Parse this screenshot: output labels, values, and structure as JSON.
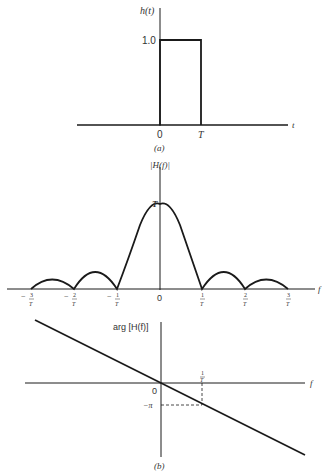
{
  "panel_a": {
    "caption": "(a)",
    "ylabel": "h(t)",
    "xlabel": "t",
    "y_tick": "1.0",
    "x_ticks": [
      "0",
      "T"
    ]
  },
  "panel_b_mag": {
    "ylabel": "|H(f)|",
    "xlabel": "f",
    "peak_label": "T",
    "origin_label": "0",
    "x_ticks": [
      {
        "sign": "−",
        "num": "3",
        "den": "T"
      },
      {
        "sign": "−",
        "num": "2",
        "den": "T"
      },
      {
        "sign": "−",
        "num": "1",
        "den": "T"
      },
      {
        "sign": "",
        "num": "1",
        "den": "T"
      },
      {
        "sign": "",
        "num": "2",
        "den": "T"
      },
      {
        "sign": "",
        "num": "3",
        "den": "T"
      }
    ]
  },
  "panel_b_phase": {
    "ylabel": "arg [H(f)]",
    "xlabel": "f",
    "origin_label": "0",
    "y_tick": "−π",
    "x_tick_num": "1",
    "x_tick_den": "T",
    "caption": "(b)"
  },
  "colors": {
    "ink": "#1a1a1a",
    "text": "#333333"
  }
}
